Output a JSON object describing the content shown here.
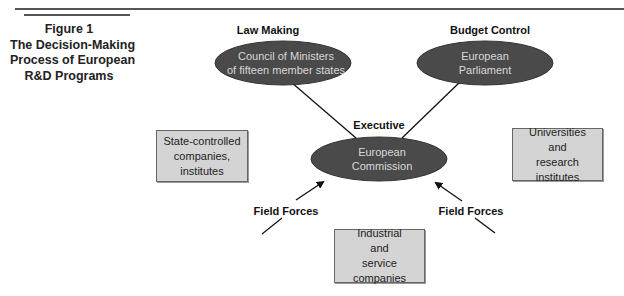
{
  "figure": {
    "number_label": "Figure 1",
    "title_lines": [
      "The Decision-Making",
      "Process of European",
      "R&D Programs"
    ]
  },
  "roles": {
    "law_making": "Law Making",
    "budget_control": "Budget Control",
    "executive": "Executive"
  },
  "ellipses": {
    "council": [
      "Council of Ministers",
      "of fifteen member states"
    ],
    "parliament": [
      "European",
      "Parliament"
    ],
    "commission": [
      "European",
      "Commission"
    ]
  },
  "boxes": {
    "state_controlled": [
      "State-controlled",
      "companies,",
      "institutes"
    ],
    "universities": [
      "Universities",
      "and",
      "research institutes"
    ],
    "industrial": [
      "Industrial",
      "and",
      "service companies"
    ]
  },
  "field_forces": {
    "left": "Field Forces",
    "right": "Field Forces"
  },
  "colors": {
    "ellipse_fill": "#4a4a4a",
    "ellipse_text": "#d8d8d8",
    "box_fill": "#d4d4d4",
    "line": "#111111"
  }
}
